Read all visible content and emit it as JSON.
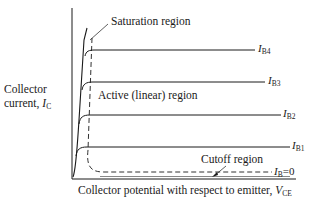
{
  "diagram": {
    "axes": {
      "y_label_line1": "Collector",
      "y_label_line2": "current, ",
      "y_symbol": "I",
      "y_symbol_sub": "C",
      "x_label": "Collector potential with respect to emitter, ",
      "x_symbol": "V",
      "x_symbol_sub": "CE"
    },
    "regions": {
      "saturation": "Saturation region",
      "active": "Active (linear) region",
      "cutoff": "Cutoff region"
    },
    "curves": [
      {
        "symbol": "I",
        "sub": "B4",
        "suffix": ""
      },
      {
        "symbol": "I",
        "sub": "B3",
        "suffix": ""
      },
      {
        "symbol": "I",
        "sub": "B2",
        "suffix": ""
      },
      {
        "symbol": "I",
        "sub": "B1",
        "suffix": ""
      },
      {
        "symbol": "I",
        "sub": "B",
        "suffix": "=0"
      }
    ],
    "colors": {
      "line": "#1a1a1a",
      "background": "#ffffff"
    }
  }
}
